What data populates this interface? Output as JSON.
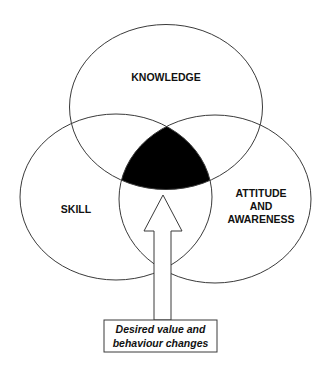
{
  "diagram": {
    "circles": [
      {
        "label_lines": [
          "KNOWLEDGE"
        ],
        "position": "top"
      },
      {
        "label_lines": [
          "SKILL"
        ],
        "position": "bottom-left"
      },
      {
        "label_lines": [
          "ATTITUDE",
          "AND",
          "AWARENESS"
        ],
        "position": "bottom-right"
      }
    ],
    "intersection": {
      "fill": "#000000",
      "meaning": "overlap of all three"
    },
    "arrow": {
      "direction": "up",
      "points_to": "intersection"
    },
    "callout": {
      "lines": [
        "Desired value and",
        "behaviour changes"
      ]
    },
    "colors": {
      "stroke": "#3a3a3a",
      "text": "#111111",
      "background": "#ffffff",
      "intersection": "#000000"
    }
  }
}
